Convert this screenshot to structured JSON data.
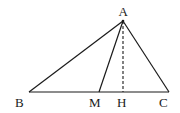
{
  "diagram": {
    "title": "",
    "points": {
      "A": {
        "label": "A",
        "x": 123,
        "y": 21
      },
      "B": {
        "label": "B",
        "x": 29,
        "y": 92
      },
      "C": {
        "label": "C",
        "x": 169,
        "y": 92
      },
      "M": {
        "label": "M",
        "x": 99,
        "y": 92
      },
      "H": {
        "label": "H",
        "x": 123,
        "y": 92
      }
    },
    "segments": [
      {
        "from": "A",
        "to": "B",
        "style": "solid"
      },
      {
        "from": "A",
        "to": "C",
        "style": "solid"
      },
      {
        "from": "B",
        "to": "C",
        "style": "solid"
      },
      {
        "from": "A",
        "to": "M",
        "style": "solid"
      },
      {
        "from": "A",
        "to": "H",
        "style": "dashed"
      }
    ],
    "labels": {
      "A": "A",
      "B": "B",
      "C": "C",
      "M": "M",
      "H": "H"
    },
    "colors": {
      "stroke": "#1a1a1a",
      "background": "#ffffff"
    }
  }
}
